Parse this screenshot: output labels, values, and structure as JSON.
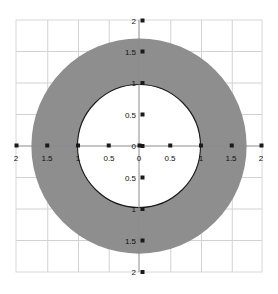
{
  "figure": {
    "background_color": "#ffffff",
    "frame_color": "#d8d8d8",
    "grid_color": "#d0d0d0",
    "axis_color": "#8a8a8a",
    "tick_mark_color": "#1a1a1a",
    "annulus_fill_color": "#8e8e8e",
    "annulus_edge_color": "#1a1a1a",
    "inner_circle_fill_color": "#ffffff"
  },
  "chart_data": {
    "type": "scatter",
    "title": "",
    "subtitle": "",
    "xlabel": "",
    "ylabel": "",
    "xlim": [
      -2,
      2
    ],
    "ylim": [
      -2,
      2
    ],
    "grid": true,
    "legend": null,
    "aspect": "equal",
    "annotations": [],
    "x_tick_values": [
      -2,
      -1.5,
      -1,
      -0.5,
      0,
      0.5,
      1,
      1.5,
      2
    ],
    "x_tick_labels": [
      "2",
      "1.5",
      "1",
      "0.5",
      "0",
      "0.5",
      "1",
      "1.5",
      "2"
    ],
    "y_tick_values": [
      2,
      1.5,
      1,
      0.5,
      0,
      -0.5,
      -1,
      -1.5,
      -2
    ],
    "y_tick_labels": [
      "2",
      "1.5",
      "1",
      "0.5",
      "0",
      "0.5",
      "1",
      "1.5",
      "2"
    ],
    "series": [
      {
        "name": "annulus",
        "type": "annulus",
        "center": [
          0,
          0
        ],
        "outer_radius": 1.75,
        "inner_radius": 1.0,
        "fill": "#8e8e8e",
        "inner_edge_visible": true,
        "outer_edge_visible": false
      }
    ]
  },
  "x_ticks": [
    {
      "label": "2",
      "value": -2
    },
    {
      "label": "1.5",
      "value": -1.5
    },
    {
      "label": "1",
      "value": -1
    },
    {
      "label": "0.5",
      "value": -0.5
    },
    {
      "label": "0",
      "value": 0
    },
    {
      "label": "0.5",
      "value": 0.5
    },
    {
      "label": "1",
      "value": 1
    },
    {
      "label": "1.5",
      "value": 1.5
    },
    {
      "label": "2",
      "value": 2
    }
  ],
  "y_ticks": [
    {
      "label": "2",
      "value": 2
    },
    {
      "label": "1.5",
      "value": 1.5
    },
    {
      "label": "1",
      "value": 1
    },
    {
      "label": "0.5",
      "value": 0.5
    },
    {
      "label": "0",
      "value": 0
    },
    {
      "label": "0.5",
      "value": -0.5
    },
    {
      "label": "1",
      "value": -1
    },
    {
      "label": "1.5",
      "value": -1.5
    },
    {
      "label": "2",
      "value": -2
    }
  ]
}
